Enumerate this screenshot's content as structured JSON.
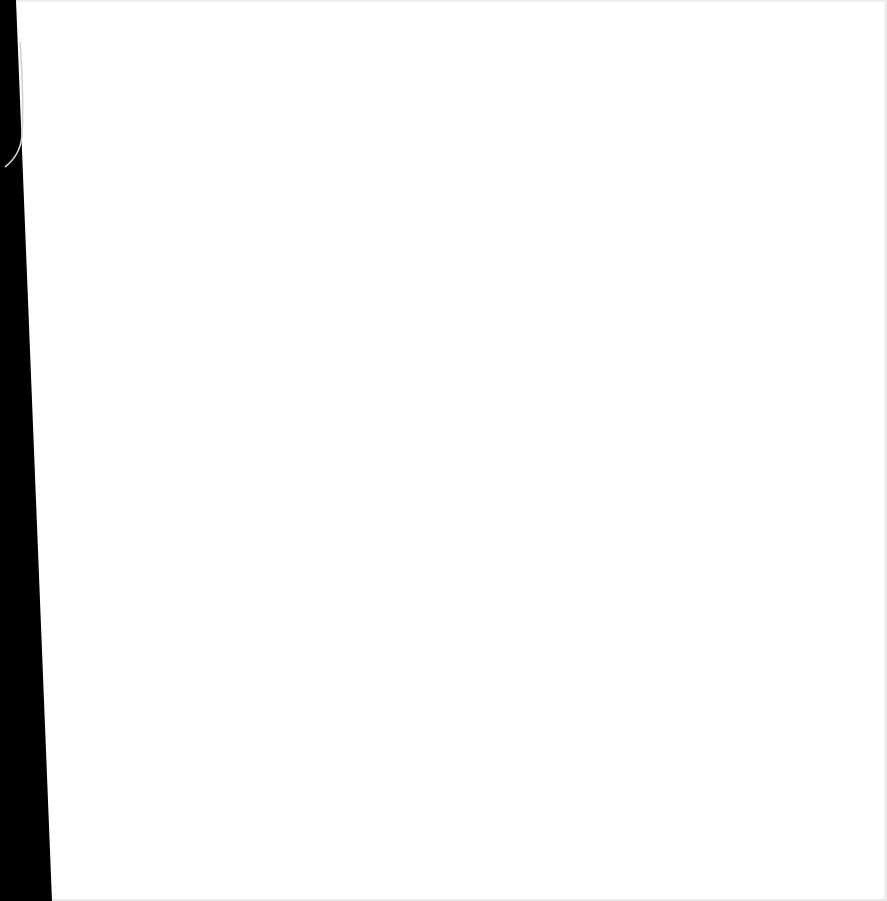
{
  "scene": {
    "description": "Blank white sheet of paper photographed against a dark background",
    "paper_color": "#ffffff",
    "background_color": "#000000",
    "thread_color": "#d8d2c4",
    "text": []
  }
}
